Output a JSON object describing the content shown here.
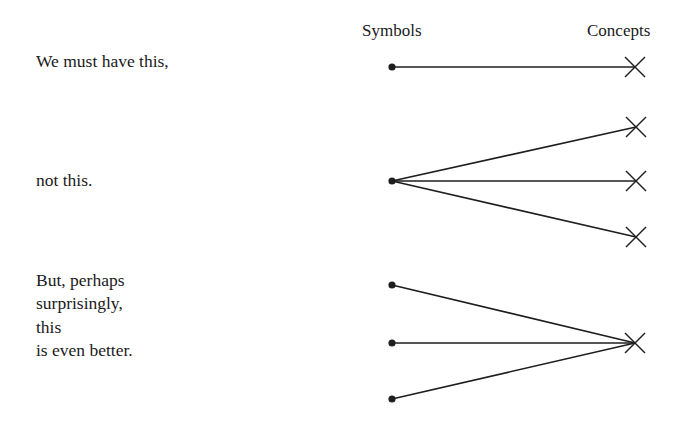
{
  "headers": {
    "symbols": "Symbols",
    "concepts": "Concepts"
  },
  "captions": {
    "first": "We must have this,",
    "second": "not this.",
    "third_lines": [
      "But, perhaps",
      "surprisingly,",
      "this",
      "is even better."
    ]
  },
  "diagram": {
    "ink_color": "#1e1e1e",
    "groups": [
      {
        "name": "one-to-one",
        "symbols": [
          [
            392,
            67
          ]
        ],
        "concepts": [
          [
            635,
            67
          ]
        ],
        "links": [
          [
            0,
            0
          ]
        ]
      },
      {
        "name": "one-to-many",
        "symbols": [
          [
            392,
            181
          ]
        ],
        "concepts": [
          [
            636,
            127
          ],
          [
            636,
            181
          ],
          [
            636,
            237
          ]
        ],
        "links": [
          [
            0,
            0
          ],
          [
            0,
            1
          ],
          [
            0,
            2
          ]
        ]
      },
      {
        "name": "many-to-one",
        "symbols": [
          [
            392,
            285
          ],
          [
            392,
            343
          ],
          [
            392,
            399
          ]
        ],
        "concepts": [
          [
            635,
            343
          ]
        ],
        "links": [
          [
            0,
            0
          ],
          [
            1,
            0
          ],
          [
            2,
            0
          ]
        ]
      }
    ]
  }
}
